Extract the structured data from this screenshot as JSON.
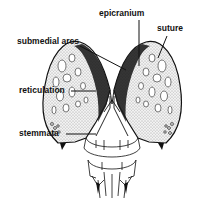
{
  "diagram": {
    "labels": [
      {
        "id": "epicranium",
        "text": "epicranium"
      },
      {
        "id": "suture",
        "text": "suture"
      },
      {
        "id": "submedial_arcs",
        "text": "submedial arcs"
      },
      {
        "id": "reticulation",
        "text": "reticulation"
      },
      {
        "id": "stemmata",
        "text": "stemmata"
      }
    ],
    "colors": {
      "ink": "#111111",
      "background": "#ffffff",
      "stipple": "#bdbdbd"
    }
  }
}
